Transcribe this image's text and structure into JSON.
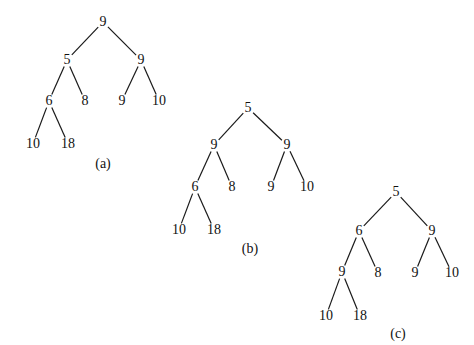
{
  "trees": [
    {
      "caption": "(a)",
      "caption_pos": [
        103,
        164
      ],
      "nodes": [
        {
          "id": "r",
          "label": "9",
          "x": 103,
          "y": 22
        },
        {
          "id": "l",
          "label": "5",
          "x": 67,
          "y": 60
        },
        {
          "id": "rr",
          "label": "9",
          "x": 141,
          "y": 60
        },
        {
          "id": "ll",
          "label": "6",
          "x": 49,
          "y": 101
        },
        {
          "id": "lr",
          "label": "8",
          "x": 85,
          "y": 101
        },
        {
          "id": "rl",
          "label": "9",
          "x": 122,
          "y": 101
        },
        {
          "id": "rrr",
          "label": "10",
          "x": 159,
          "y": 101
        },
        {
          "id": "lll",
          "label": "10",
          "x": 33,
          "y": 144
        },
        {
          "id": "llr",
          "label": "18",
          "x": 68,
          "y": 144
        }
      ],
      "edges": [
        [
          "r",
          "l"
        ],
        [
          "r",
          "rr"
        ],
        [
          "l",
          "ll"
        ],
        [
          "l",
          "lr"
        ],
        [
          "rr",
          "rl"
        ],
        [
          "rr",
          "rrr"
        ],
        [
          "ll",
          "lll"
        ],
        [
          "ll",
          "llr"
        ]
      ]
    },
    {
      "caption": "(b)",
      "caption_pos": [
        250,
        249
      ],
      "nodes": [
        {
          "id": "r",
          "label": "5",
          "x": 248,
          "y": 108
        },
        {
          "id": "l",
          "label": "9",
          "x": 214,
          "y": 145
        },
        {
          "id": "rr",
          "label": "9",
          "x": 287,
          "y": 145
        },
        {
          "id": "ll",
          "label": "6",
          "x": 195,
          "y": 187
        },
        {
          "id": "lr",
          "label": "8",
          "x": 232,
          "y": 187
        },
        {
          "id": "rl",
          "label": "9",
          "x": 271,
          "y": 187
        },
        {
          "id": "rrr",
          "label": "10",
          "x": 307,
          "y": 187
        },
        {
          "id": "lll",
          "label": "10",
          "x": 179,
          "y": 230
        },
        {
          "id": "llr",
          "label": "18",
          "x": 214,
          "y": 230
        }
      ],
      "edges": [
        [
          "r",
          "l"
        ],
        [
          "r",
          "rr"
        ],
        [
          "l",
          "ll"
        ],
        [
          "l",
          "lr"
        ],
        [
          "rr",
          "rl"
        ],
        [
          "rr",
          "rrr"
        ],
        [
          "ll",
          "lll"
        ],
        [
          "ll",
          "llr"
        ]
      ]
    },
    {
      "caption": "(c)",
      "caption_pos": [
        398,
        334
      ],
      "nodes": [
        {
          "id": "r",
          "label": "5",
          "x": 396,
          "y": 192
        },
        {
          "id": "l",
          "label": "6",
          "x": 359,
          "y": 231
        },
        {
          "id": "rr",
          "label": "9",
          "x": 432,
          "y": 231
        },
        {
          "id": "ll",
          "label": "9",
          "x": 342,
          "y": 272
        },
        {
          "id": "lr",
          "label": "8",
          "x": 378,
          "y": 273
        },
        {
          "id": "rl",
          "label": "9",
          "x": 415,
          "y": 273
        },
        {
          "id": "rrr",
          "label": "10",
          "x": 452,
          "y": 273
        },
        {
          "id": "lll",
          "label": "10",
          "x": 326,
          "y": 316
        },
        {
          "id": "llr",
          "label": "18",
          "x": 360,
          "y": 316
        }
      ],
      "edges": [
        [
          "r",
          "l"
        ],
        [
          "r",
          "rr"
        ],
        [
          "l",
          "ll"
        ],
        [
          "l",
          "lr"
        ],
        [
          "rr",
          "rl"
        ],
        [
          "rr",
          "rrr"
        ],
        [
          "ll",
          "lll"
        ],
        [
          "ll",
          "llr"
        ]
      ]
    }
  ]
}
